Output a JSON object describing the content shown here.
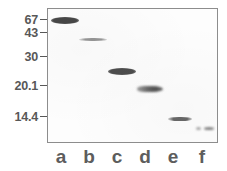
{
  "figure": {
    "type": "gel-electrophoresis",
    "colors": {
      "background": "#ffffff",
      "gel_background": "#fdfdfd",
      "frame_border": "#8d8d8d",
      "label_text": "#585858",
      "lane_label_text": "#5d5d5d",
      "band": "#3a3a3a"
    }
  },
  "chart_data": {
    "type": "gel",
    "title": "",
    "xlabel": "",
    "ylabel": "",
    "axis": {
      "name": "molecular-weight-markers",
      "units": "kDa",
      "tick_labels": [
        "67",
        "43",
        "30",
        "20.1",
        "14.4"
      ],
      "tick_values": [
        67,
        43,
        30,
        20.1,
        14.4
      ],
      "tick_y_px": [
        20,
        33,
        57,
        86,
        117
      ],
      "scale": "log-linear (decreasing downward)"
    },
    "lanes": [
      {
        "label": "a",
        "label_x_px": 61,
        "band": {
          "x_px": 51,
          "y_px": 17,
          "width_px": 28,
          "height_px": 7,
          "apparent_mw_kda": 67,
          "intensity": "very strong",
          "shape": "ellipse",
          "opacity": 0.93
        }
      },
      {
        "label": "b",
        "label_x_px": 89,
        "band": {
          "x_px": 79,
          "y_px": 38,
          "width_px": 28,
          "height_px": 3,
          "apparent_mw_kda": 40,
          "intensity": "faint",
          "shape": "thin-line",
          "opacity": 0.52
        }
      },
      {
        "label": "c",
        "label_x_px": 117,
        "band": {
          "x_px": 108,
          "y_px": 68,
          "width_px": 28,
          "height_px": 7,
          "apparent_mw_kda": 27,
          "intensity": "strong",
          "shape": "ellipse",
          "opacity": 0.9
        }
      },
      {
        "label": "d",
        "label_x_px": 145,
        "band": {
          "x_px": 137,
          "y_px": 86,
          "width_px": 26,
          "height_px": 6,
          "apparent_mw_kda": 21,
          "intensity": "strong",
          "shape": "wedge-right-heavy",
          "opacity": 0.88
        }
      },
      {
        "label": "e",
        "label_x_px": 173,
        "band": {
          "x_px": 168,
          "y_px": 117,
          "width_px": 24,
          "height_px": 4,
          "apparent_mw_kda": 14.4,
          "intensity": "moderate",
          "shape": "thin-line",
          "opacity": 0.76
        }
      },
      {
        "label": "f",
        "label_x_px": 200,
        "band": {
          "x_px": 196,
          "y_px": 127,
          "width_px": 18,
          "height_px": 3,
          "apparent_mw_kda": 12,
          "intensity": "faint-split",
          "shape": "split-dots",
          "opacity": 0.62
        }
      }
    ]
  },
  "markers": [
    {
      "label": "67",
      "top_px": 14
    },
    {
      "label": "43",
      "top_px": 27
    },
    {
      "label": "30",
      "top_px": 51
    },
    {
      "label": "20.1",
      "top_px": 80
    },
    {
      "label": "14.4",
      "top_px": 111
    }
  ],
  "lane_labels": [
    {
      "label": "a",
      "left_px": 3
    },
    {
      "label": "b",
      "left_px": 31
    },
    {
      "label": "c",
      "left_px": 59
    },
    {
      "label": "d",
      "left_px": 87
    },
    {
      "label": "e",
      "left_px": 115
    },
    {
      "label": "f",
      "left_px": 144
    }
  ]
}
